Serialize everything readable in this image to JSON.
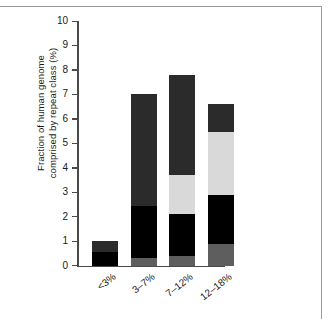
{
  "figure": {
    "title": "",
    "accent_dark": "#2b2b2b",
    "accent_black": "#000000",
    "accent_light": "#d9d9d9",
    "accent_mid": "#5e5e5e",
    "axis_color": "#4a4a4a"
  },
  "axis": {
    "y_title_line1": "Fraction of human genome",
    "y_title_line2": "comprised by repeat class (%)",
    "y_ticks": [
      "0",
      "1",
      "2",
      "3",
      "4",
      "5",
      "6",
      "7",
      "8",
      "9",
      "10"
    ],
    "x_ticks": [
      "<3%",
      "3–7%",
      "7–12%",
      "12–18%"
    ]
  },
  "chart_data": {
    "type": "bar",
    "stacked": true,
    "title": "",
    "xlabel": "",
    "ylabel": "Fraction of human genome comprised by repeat class (%)",
    "ylim": [
      0,
      10
    ],
    "ytick_step": 1,
    "grid": false,
    "legend": "none",
    "categories": [
      "<3%",
      "3–7%",
      "7–12%",
      "12–18%"
    ],
    "series": [
      {
        "name": "segment-bottom-gray",
        "color": "#5e5e5e",
        "values": [
          0.0,
          0.32,
          0.38,
          0.9
        ]
      },
      {
        "name": "segment-black",
        "color": "#000000",
        "values": [
          0.55,
          2.13,
          1.73,
          2.0
        ]
      },
      {
        "name": "segment-light-gray",
        "color": "#d9d9d9",
        "values": [
          0.0,
          0.0,
          1.6,
          2.55
        ]
      },
      {
        "name": "segment-dark-gray",
        "color": "#2b2b2b",
        "values": [
          0.45,
          4.55,
          4.1,
          1.15
        ]
      }
    ],
    "totals": [
      1.0,
      7.0,
      7.8,
      6.6
    ],
    "segment_boundaries": {
      "<3%": [
        0.0,
        0.55,
        1.0
      ],
      "3–7%": [
        0.0,
        0.32,
        2.45,
        7.0
      ],
      "7–12%": [
        0.0,
        0.38,
        2.11,
        3.71,
        7.8
      ],
      "12–18%": [
        0.0,
        0.9,
        2.9,
        5.45,
        6.6
      ]
    }
  }
}
